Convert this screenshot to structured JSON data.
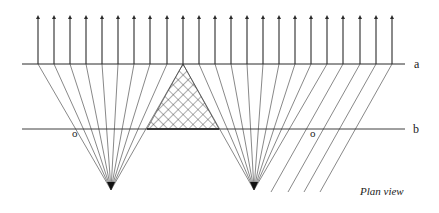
{
  "diagram": {
    "title": "Plan view",
    "caption": "Plan view",
    "labels": {
      "line_a": "a",
      "line_b": "b",
      "origin_left": "o",
      "origin_right": "o"
    },
    "colors": {
      "line": "#2a2a2a",
      "thin_line": "#555555",
      "hatch": "#333333",
      "background": "#ffffff"
    },
    "geometry": {
      "arrow_top_y": 15,
      "line_a_y": 64,
      "line_b_y": 129,
      "line_a_x": [
        22,
        405
      ],
      "line_b_x": [
        22,
        405
      ],
      "arrow_xs": [
        38,
        54,
        70,
        86,
        102,
        118,
        134,
        150,
        167,
        183,
        199,
        215,
        231,
        247,
        263,
        279,
        295,
        311,
        327,
        343,
        360,
        376,
        392
      ],
      "focal_left": [
        111,
        190
      ],
      "focal_right": [
        254,
        190
      ],
      "left_fan_arrow_indices": [
        0,
        1,
        2,
        3,
        4,
        5,
        6,
        7,
        8
      ],
      "right_fan_arrow_indices": [
        10,
        11,
        12,
        13,
        14,
        15,
        16,
        17,
        18
      ],
      "parallel_arrow_indices": [
        19,
        20,
        21,
        22
      ],
      "parallel_bottom_y": 192,
      "parallel_bottom_xs": [
        271,
        288,
        304,
        320
      ],
      "hatched_triangle": [
        [
          183,
          64
        ],
        [
          147,
          129
        ],
        [
          219,
          129
        ]
      ],
      "label_a_pos": [
        414,
        68
      ],
      "label_b_pos": [
        413,
        133
      ],
      "origin_left_pos": [
        72,
        137
      ],
      "origin_right_pos": [
        310,
        137
      ],
      "caption_pos": [
        360,
        195
      ]
    }
  }
}
